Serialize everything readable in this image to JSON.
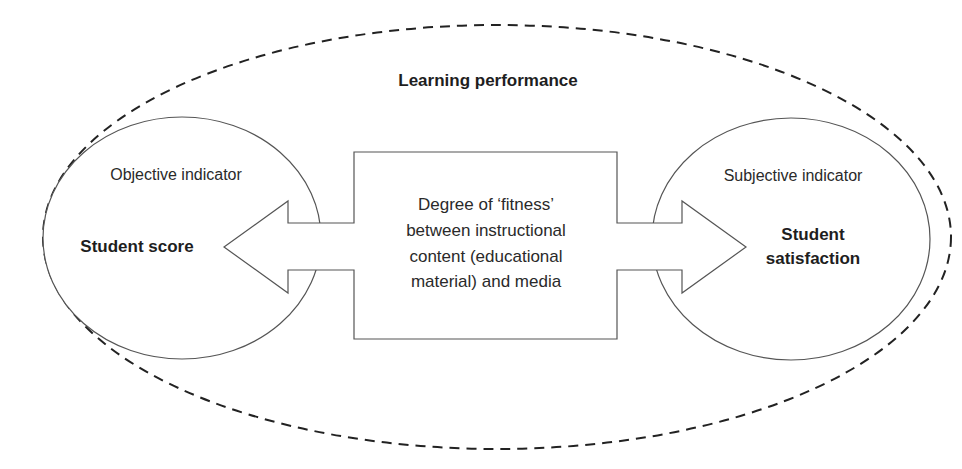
{
  "diagram": {
    "outer_label": "Learning performance",
    "center_box": {
      "lines": [
        "Degree of ‘fitness’",
        "between instructional",
        "content (educational",
        "material) and media"
      ]
    },
    "left_node": {
      "indicator": "Objective indicator",
      "label_lines": [
        "Student score"
      ]
    },
    "right_node": {
      "indicator": "Subjective indicator",
      "label_lines": [
        "Student",
        "satisfaction"
      ]
    },
    "arrows": [
      {
        "from": "center_box",
        "to": "left_node",
        "style": "block-arrow"
      },
      {
        "from": "center_box",
        "to": "right_node",
        "style": "block-arrow"
      }
    ],
    "colors": {
      "stroke": "#555555",
      "dashed_stroke": "#222222",
      "text": "#2a2a2a",
      "background": "#ffffff"
    }
  }
}
